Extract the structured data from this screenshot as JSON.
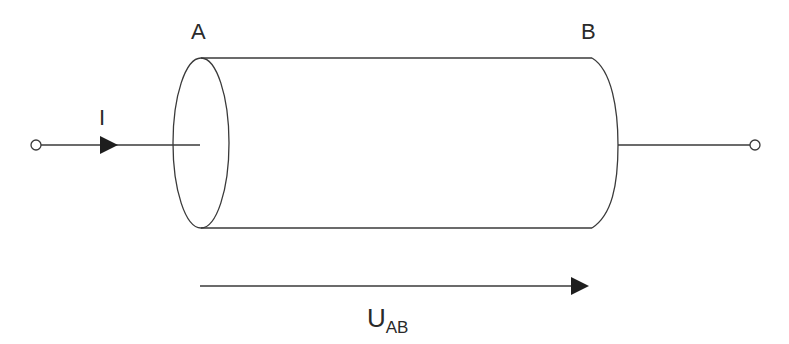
{
  "diagram": {
    "labels": {
      "point_a": "A",
      "point_b": "B",
      "current": "I",
      "voltage_main": "U",
      "voltage_sub": "AB"
    },
    "colors": {
      "stroke": "#3a3a3a",
      "fill_arrow": "#1e1e1e",
      "background": "#ffffff"
    }
  }
}
